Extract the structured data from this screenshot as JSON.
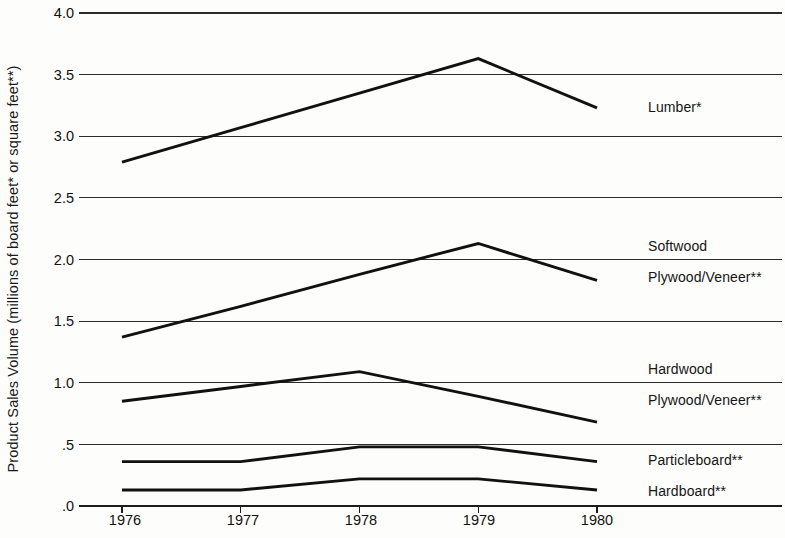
{
  "chart_data": {
    "type": "line",
    "title": "",
    "xlabel": "",
    "ylabel": "Product Sales Volume (millions of board feet* or square feet**)",
    "x": [
      1976,
      1977,
      1978,
      1979,
      1980
    ],
    "xtick_labels": [
      "1976",
      "1977",
      "1978",
      "1979",
      "1980"
    ],
    "ytick_labels": [
      ".0",
      ".5",
      "1.0",
      "1.5",
      "2.0",
      "2.5",
      "3.0",
      "3.5",
      "4.0"
    ],
    "ytick_values": [
      0.0,
      0.5,
      1.0,
      1.5,
      2.0,
      2.5,
      3.0,
      3.5,
      4.0
    ],
    "ylim": [
      0.0,
      4.0
    ],
    "grid": true,
    "legend_position": "right-inline",
    "series": [
      {
        "name": "Lumber*",
        "label_lines": [
          "Lumber*"
        ],
        "values": [
          2.79,
          3.07,
          3.35,
          3.63,
          3.23
        ]
      },
      {
        "name": "Softwood Plywood/Veneer**",
        "label_lines": [
          "Softwood",
          "Plywood/Veneer**"
        ],
        "values": [
          1.37,
          1.62,
          1.88,
          2.13,
          1.83
        ]
      },
      {
        "name": "Hardwood Plywood/Veneer**",
        "label_lines": [
          "Hardwood",
          "Plywood/Veneer**"
        ],
        "values": [
          0.85,
          0.97,
          1.09,
          0.89,
          0.68
        ]
      },
      {
        "name": "Particleboard**",
        "label_lines": [
          "Particleboard**"
        ],
        "values": [
          0.36,
          0.36,
          0.48,
          0.48,
          0.36
        ]
      },
      {
        "name": "Hardboard**",
        "label_lines": [
          "Hardboard**"
        ],
        "values": [
          0.13,
          0.13,
          0.22,
          0.22,
          0.13
        ]
      }
    ]
  },
  "axis": {
    "y_title": "Product Sales Volume (millions of board feet* or square feet**)"
  },
  "series_labels": {
    "lumber": "Lumber*",
    "softwood_line1": "Softwood",
    "softwood_line2": "Plywood/Veneer**",
    "hardwood_line1": "Hardwood",
    "hardwood_line2": "Plywood/Veneer**",
    "particleboard": "Particleboard**",
    "hardboard": "Hardboard**"
  },
  "y_ticks": {
    "t0": ".0",
    "t1": ".5",
    "t2": "1.0",
    "t3": "1.5",
    "t4": "2.0",
    "t5": "2.5",
    "t6": "3.0",
    "t7": "3.5",
    "t8": "4.0"
  },
  "x_ticks": {
    "t0": "1976",
    "t1": "1977",
    "t2": "1978",
    "t3": "1979",
    "t4": "1980"
  },
  "colors": {
    "background": "#fdfdfc",
    "line": "#111111",
    "gridline": "#2b2b2b",
    "text": "#111111"
  }
}
